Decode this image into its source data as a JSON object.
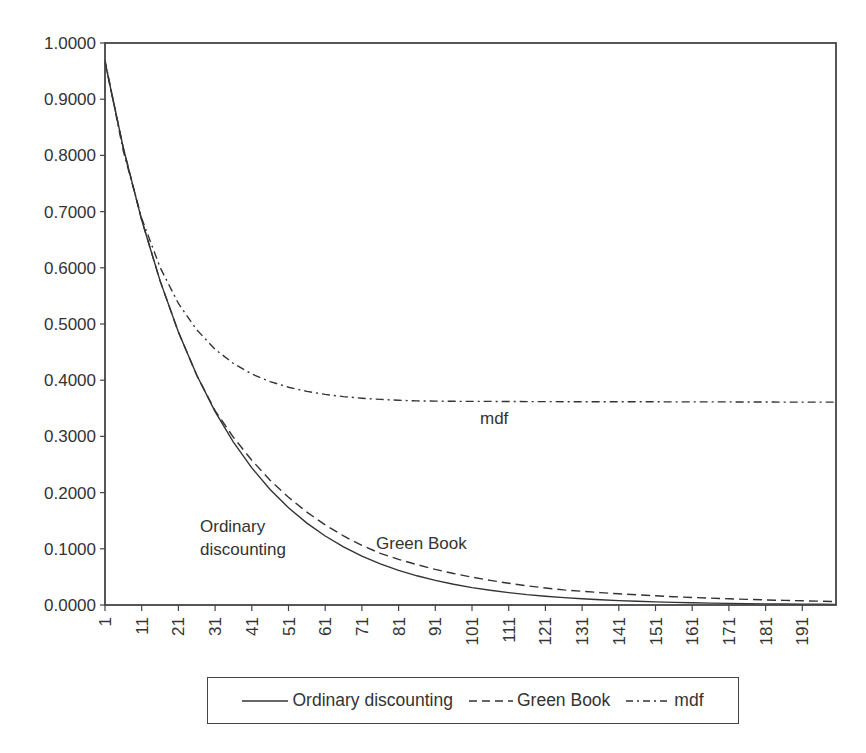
{
  "chart_data": {
    "type": "line",
    "title": "",
    "xlabel": "",
    "ylabel": "",
    "ylim": [
      0,
      1
    ],
    "xlim": [
      1,
      200
    ],
    "grid": false,
    "legend_position": "bottom",
    "y_ticks": [
      "0.0000",
      "0.1000",
      "0.2000",
      "0.3000",
      "0.4000",
      "0.5000",
      "0.6000",
      "0.7000",
      "0.8000",
      "0.9000",
      "1.0000"
    ],
    "x_ticks": [
      "1",
      "11",
      "21",
      "31",
      "41",
      "51",
      "61",
      "71",
      "81",
      "91",
      "101",
      "111",
      "121",
      "131",
      "141",
      "151",
      "161",
      "171",
      "181",
      "191"
    ],
    "x": [
      1,
      6,
      11,
      16,
      21,
      26,
      31,
      36,
      41,
      46,
      51,
      56,
      61,
      66,
      71,
      76,
      81,
      86,
      91,
      96,
      101,
      106,
      111,
      116,
      121,
      126,
      131,
      136,
      141,
      146,
      151,
      156,
      161,
      166,
      171,
      176,
      181,
      186,
      191,
      196,
      200
    ],
    "series": [
      {
        "name": "Ordinary discounting",
        "style": "solid",
        "values": [
          0.9662,
          0.8135,
          0.6849,
          0.5767,
          0.4856,
          0.4088,
          0.3442,
          0.2898,
          0.244,
          0.2055,
          0.173,
          0.1457,
          0.1227,
          0.1033,
          0.0869,
          0.0732,
          0.0616,
          0.0519,
          0.0437,
          0.0368,
          0.031,
          0.0261,
          0.022,
          0.0185,
          0.0156,
          0.0131,
          0.011,
          0.0093,
          0.0078,
          0.0066,
          0.0055,
          0.0047,
          0.0039,
          0.0033,
          0.0028,
          0.0024,
          0.002,
          0.0017,
          0.0014,
          0.0012,
          0.001
        ]
      },
      {
        "name": "Green Book",
        "style": "dashed",
        "values": [
          0.9662,
          0.8135,
          0.6849,
          0.5767,
          0.4856,
          0.4088,
          0.3459,
          0.2984,
          0.2574,
          0.2221,
          0.1916,
          0.1653,
          0.1426,
          0.123,
          0.1061,
          0.0919,
          0.0812,
          0.0718,
          0.0634,
          0.0561,
          0.0496,
          0.0438,
          0.0387,
          0.0342,
          0.0302,
          0.0269,
          0.0243,
          0.022,
          0.0199,
          0.0181,
          0.0164,
          0.0148,
          0.0134,
          0.0122,
          0.011,
          0.01,
          0.009,
          0.0082,
          0.0074,
          0.0067,
          0.0062
        ]
      },
      {
        "name": "mdf",
        "style": "dash-dot",
        "values": [
          0.97,
          0.8074,
          0.6881,
          0.6007,
          0.5365,
          0.4895,
          0.455,
          0.4297,
          0.4111,
          0.3975,
          0.3875,
          0.3801,
          0.3748,
          0.3708,
          0.3679,
          0.3658,
          0.3643,
          0.3632,
          0.3628,
          0.3625,
          0.3623,
          0.3622,
          0.3621,
          0.362,
          0.3619,
          0.3618,
          0.3617,
          0.3616,
          0.3616,
          0.3615,
          0.3615,
          0.3614,
          0.3614,
          0.3613,
          0.3613,
          0.3612,
          0.3612,
          0.3611,
          0.3611,
          0.361,
          0.361
        ]
      }
    ],
    "annotations": [
      {
        "text": "mdf",
        "x": 95,
        "y": 0.33
      },
      {
        "text": "Ordinary",
        "x": 27,
        "y": 0.13
      },
      {
        "text": "discounting",
        "x": 27,
        "y": 0.09
      },
      {
        "text": "Green Book",
        "x": 75,
        "y": 0.1
      }
    ]
  },
  "legend": {
    "items": [
      {
        "label": "Ordinary discounting",
        "style": "solid"
      },
      {
        "label": "Green Book",
        "style": "dashed"
      },
      {
        "label": "mdf",
        "style": "dash-dot"
      }
    ]
  },
  "colors": {
    "line": "#333333",
    "axis": "#444444"
  }
}
